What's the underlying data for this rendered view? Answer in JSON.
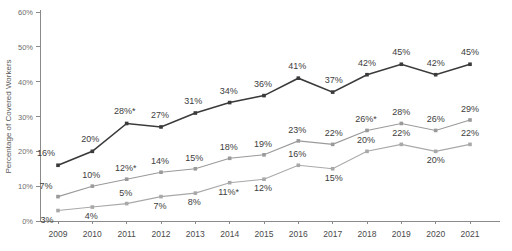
{
  "chart_data": {
    "type": "line",
    "title": "",
    "subtitle": "",
    "xlabel": "",
    "ylabel": "Percentage of Covered Workers",
    "categories": [
      "2009",
      "2010",
      "2011",
      "2012",
      "2013",
      "2014",
      "2015",
      "2016",
      "2017",
      "2018",
      "2019",
      "2020",
      "2021"
    ],
    "x": [
      2009,
      2010,
      2011,
      2012,
      2013,
      2014,
      2015,
      2016,
      2017,
      2018,
      2019,
      2020,
      2021
    ],
    "ylim": [
      0,
      60
    ],
    "yticks": [
      0,
      10,
      20,
      30,
      40,
      50,
      60
    ],
    "ytick_labels": [
      "0%",
      "10%",
      "20%",
      "30%",
      "40%",
      "50%",
      "60%"
    ],
    "grid": false,
    "legend": "none",
    "series": [
      {
        "name": "series-top",
        "color": "#3a3a3a",
        "values": [
          16,
          20,
          28,
          27,
          31,
          34,
          36,
          41,
          37,
          42,
          45,
          42,
          45
        ],
        "labels": [
          "16%",
          "20%",
          "28%*",
          "27%",
          "31%",
          "34%",
          "36%",
          "41%",
          "37%",
          "42%",
          "45%",
          "42%",
          "45%"
        ]
      },
      {
        "name": "series-middle",
        "color": "#9a9a9a",
        "values": [
          7,
          10,
          12,
          14,
          15,
          18,
          19,
          23,
          22,
          26,
          28,
          26,
          29
        ],
        "labels": [
          "7%",
          "10%",
          "12%*",
          "14%",
          "15%",
          "18%",
          "19%",
          "23%",
          "22%",
          "26%*",
          "28%",
          "26%",
          "29%"
        ]
      },
      {
        "name": "series-bottom",
        "color": "#a8a8a8",
        "values": [
          3,
          4,
          5,
          7,
          8,
          11,
          12,
          16,
          15,
          20,
          22,
          20,
          22
        ],
        "labels": [
          "3%",
          "4%",
          "5%",
          "7%",
          "8%",
          "11%*",
          "12%",
          "16%",
          "15%",
          "20%",
          "22%",
          "20%",
          "22%"
        ]
      }
    ],
    "label_offsets": {
      "series-top": [
        {
          "dx": -12,
          "dy": -9
        },
        {
          "dx": -2,
          "dy": -9
        },
        {
          "dx": -2,
          "dy": -9
        },
        {
          "dx": -1,
          "dy": -9
        },
        {
          "dx": -2,
          "dy": -9
        },
        {
          "dx": -1,
          "dy": -9
        },
        {
          "dx": -1,
          "dy": -9
        },
        {
          "dx": -1,
          "dy": -9
        },
        {
          "dx": 1,
          "dy": -9
        },
        {
          "dx": 0,
          "dy": -9
        },
        {
          "dx": 0,
          "dy": -9
        },
        {
          "dx": 0,
          "dy": -9
        },
        {
          "dx": 0,
          "dy": -9
        }
      ],
      "series-middle": [
        {
          "dx": -12,
          "dy": -8
        },
        {
          "dx": -1,
          "dy": -8
        },
        {
          "dx": -1,
          "dy": -8
        },
        {
          "dx": -1,
          "dy": -8
        },
        {
          "dx": -1,
          "dy": -8
        },
        {
          "dx": -1,
          "dy": -8
        },
        {
          "dx": -1,
          "dy": -8
        },
        {
          "dx": -1,
          "dy": -8
        },
        {
          "dx": 1,
          "dy": -8
        },
        {
          "dx": -1,
          "dy": -8
        },
        {
          "dx": 0,
          "dy": -8
        },
        {
          "dx": 0,
          "dy": -8
        },
        {
          "dx": 0,
          "dy": -8
        }
      ],
      "series-bottom": [
        {
          "dx": -11,
          "dy": 12
        },
        {
          "dx": -1,
          "dy": 12
        },
        {
          "dx": -1,
          "dy": -8
        },
        {
          "dx": -1,
          "dy": 12
        },
        {
          "dx": -1,
          "dy": 12
        },
        {
          "dx": -1,
          "dy": 12
        },
        {
          "dx": -1,
          "dy": 12
        },
        {
          "dx": -1,
          "dy": -8
        },
        {
          "dx": 1,
          "dy": 12
        },
        {
          "dx": -1,
          "dy": -8
        },
        {
          "dx": 0,
          "dy": -8
        },
        {
          "dx": 0,
          "dy": 12
        },
        {
          "dx": 0,
          "dy": -8
        }
      ]
    }
  }
}
